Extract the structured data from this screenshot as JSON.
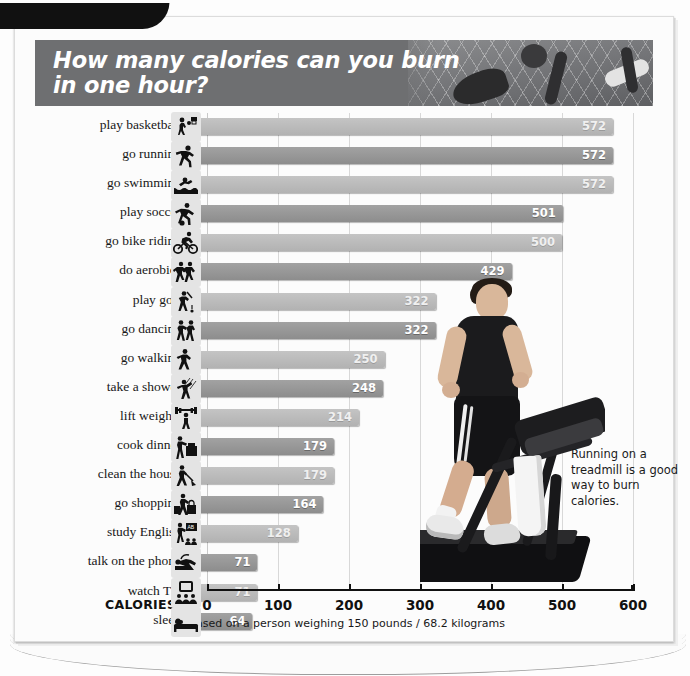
{
  "header": {
    "title": "How many calories can you burn in one hour?",
    "banner_color": "#6e6f71",
    "photo_alt": "volleyball-players-photo"
  },
  "callout": {
    "text": "Running on a treadmill is a good way to burn calories."
  },
  "axis": {
    "title": "CALORIES*",
    "footnote": "*Based on a person weighing 150 pounds / 68.2 kilograms",
    "ticks": [
      "0",
      "100",
      "200",
      "300",
      "400",
      "500",
      "600"
    ]
  },
  "chart_data": {
    "type": "bar",
    "orientation": "horizontal",
    "title": "How many calories can you burn in one hour?",
    "xlabel": "CALORIES*",
    "ylabel": "",
    "xlim": [
      0,
      600
    ],
    "xticks": [
      0,
      100,
      200,
      300,
      400,
      500,
      600
    ],
    "grid": true,
    "legend": false,
    "note": "*Based on a person weighing 150 pounds / 68.2 kilograms",
    "annotations": [
      "Running on a treadmill is a good way to burn calories."
    ],
    "categories": [
      "play basketball",
      "go running",
      "go swimming",
      "play soccer",
      "go bike riding",
      "do aerobics",
      "play golf",
      "go dancing",
      "go walking",
      "take a shower",
      "lift weights",
      "cook dinner",
      "clean the house",
      "go shopping",
      "study English",
      "talk on the phone",
      "watch TV",
      "sleep"
    ],
    "values": [
      572,
      572,
      572,
      501,
      500,
      429,
      322,
      322,
      250,
      248,
      214,
      179,
      179,
      164,
      128,
      71,
      71,
      64
    ],
    "icons": [
      "basketball-icon",
      "running-icon",
      "swimming-icon",
      "soccer-icon",
      "cycling-icon",
      "aerobics-icon",
      "golf-icon",
      "dancing-icon",
      "walking-icon",
      "shower-icon",
      "weightlifting-icon",
      "cooking-icon",
      "cleaning-icon",
      "shopping-icon",
      "studying-icon",
      "phone-icon",
      "television-icon",
      "sleeping-icon"
    ],
    "bar_colors": [
      "#b8b8b8",
      "#969696"
    ]
  }
}
